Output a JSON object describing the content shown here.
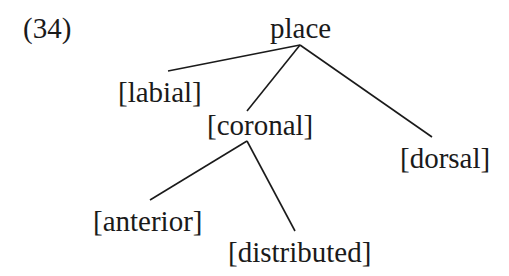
{
  "example_number": "(34)",
  "tree": {
    "root": "place",
    "nodes": {
      "labial": "[labial]",
      "coronal": "[coronal]",
      "dorsal": "[dorsal]",
      "anterior": "[anterior]",
      "distributed": "[distributed]"
    },
    "edges": [
      [
        "place",
        "[labial]"
      ],
      [
        "place",
        "[coronal]"
      ],
      [
        "place",
        "[dorsal]"
      ],
      [
        "[coronal]",
        "[anterior]"
      ],
      [
        "[coronal]",
        "[distributed]"
      ]
    ]
  },
  "colors": {
    "ink": "#1a1a1a",
    "background": "#ffffff"
  }
}
